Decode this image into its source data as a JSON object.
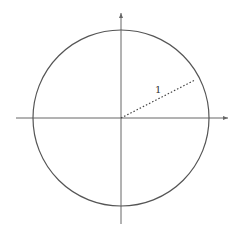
{
  "diagram": {
    "type": "unit-circle",
    "radius_label": "1",
    "center": [
      121,
      118
    ],
    "radius_px": 88,
    "radius_endpoint": [
      195,
      80
    ],
    "axes": {
      "x": {
        "from": 16,
        "to": 228
      },
      "y": {
        "from": 13,
        "to": 224
      }
    },
    "colors": {
      "stroke": "#555555",
      "axis": "#666666",
      "dotted": "#444444"
    }
  }
}
